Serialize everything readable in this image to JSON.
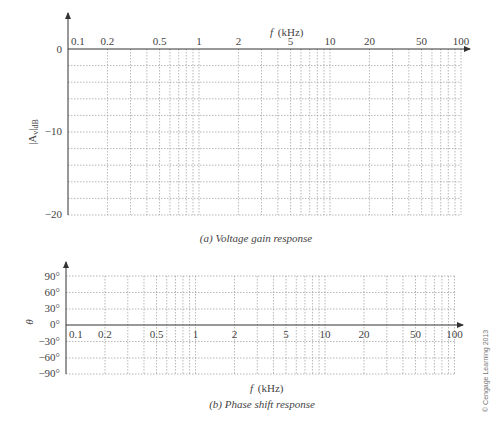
{
  "chart_data": [
    {
      "type": "line",
      "title": "(a) Voltage gain response",
      "xlabel": "f (kHz)",
      "ylabel": "|Av|dB",
      "xscale": "log",
      "xlim": [
        0.1,
        100
      ],
      "ylim": [
        -20,
        0
      ],
      "x_tick_labels": [
        "0.1",
        "0.2",
        "0.5",
        "1",
        "2",
        "5",
        "10",
        "20",
        "50",
        "100"
      ],
      "y_tick_labels": [
        "0",
        "-10",
        "-20"
      ],
      "y_gridlines": [
        0,
        -2,
        -4,
        -6,
        -8,
        -10,
        -12,
        -14,
        -16,
        -18,
        -20
      ],
      "grid": true,
      "series": []
    },
    {
      "type": "line",
      "title": "(b) Phase shift response",
      "xlabel": "f (kHz)",
      "ylabel": "θ",
      "xscale": "log",
      "xlim": [
        0.1,
        100
      ],
      "ylim": [
        -90,
        90
      ],
      "x_tick_labels": [
        "0.1",
        "0.2",
        "0.5",
        "1",
        "2",
        "5",
        "10",
        "20",
        "50",
        "100"
      ],
      "y_tick_labels": [
        "90°",
        "60°",
        "30°",
        "0°",
        "-30°",
        "-60°",
        "-90°"
      ],
      "grid": true,
      "series": []
    }
  ],
  "gain": {
    "xlabel_f": "f",
    "xlabel_unit": "(kHz)",
    "ylabel_main": "|A",
    "ylabel_sub": "v",
    "ylabel_tail": "|",
    "ylabel_db": "dB",
    "yticks": [
      "0",
      "−10",
      "−20"
    ],
    "xticks": [
      "0.1",
      "0.2",
      "0.5",
      "1",
      "2",
      "5",
      "10",
      "20",
      "50",
      "100"
    ],
    "caption": "(a) Voltage gain response"
  },
  "phase": {
    "xlabel_f": "f",
    "xlabel_unit": "(kHz)",
    "ylabel": "θ",
    "yticks": [
      "90°",
      "60°",
      "30°",
      "0°",
      "−30°",
      "−60°",
      "−90°"
    ],
    "xticks": [
      "0.1",
      "0.2",
      "0.5",
      "1",
      "2",
      "5",
      "10",
      "20",
      "50",
      "100"
    ],
    "caption": "(b) Phase shift response"
  },
  "copyright": "© Cengage Learning 2013"
}
